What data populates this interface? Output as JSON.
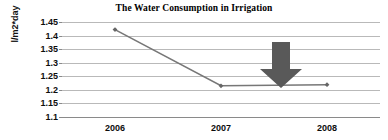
{
  "chart_data": {
    "type": "line",
    "title": "The Water Consumption in Irrigation",
    "xlabel": "",
    "ylabel": "l/m2*day",
    "categories": [
      "2006",
      "2007",
      "2008"
    ],
    "x_tick_labels": [
      "2006",
      "2007",
      "2008"
    ],
    "y_tick_labels": [
      "1.45",
      "1.4",
      "1.35",
      "1.3",
      "1.25",
      "1.2",
      "1.15",
      "1.1"
    ],
    "y_tick_values": [
      1.45,
      1.4,
      1.35,
      1.3,
      1.25,
      1.2,
      1.15,
      1.1
    ],
    "ylim": [
      1.1,
      1.45
    ],
    "grid": true,
    "legend": false,
    "series": [
      {
        "name": "Water consumption",
        "values": [
          1.422,
          1.215,
          1.219
        ],
        "color": "#777777",
        "marker": "diamond",
        "marker_color": "#666666"
      }
    ],
    "annotations": [
      {
        "type": "down-arrow",
        "color": "#595959",
        "x_value": 2.5,
        "y_top": 1.375,
        "y_bottom": 1.2125
      }
    ]
  },
  "colors": {
    "gridline": "#b9b9b9",
    "axis": "#8a8a8a",
    "text": "#0d0d0d",
    "background": "#ffffff"
  }
}
